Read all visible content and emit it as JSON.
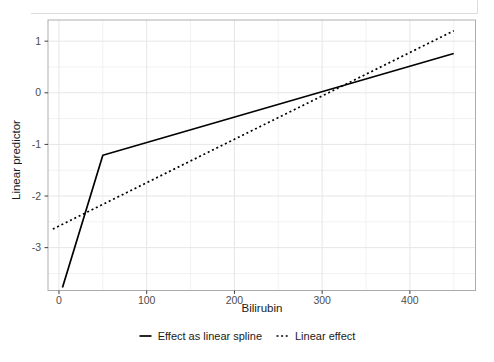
{
  "chart_data": {
    "type": "line",
    "title": "",
    "xlabel": "Bilirubin",
    "ylabel": "Linear predictor",
    "x_ticks": [
      0,
      100,
      200,
      300,
      400
    ],
    "x_tick_labels": [
      "0",
      "100",
      "200",
      "300",
      "400"
    ],
    "x_minor_ticks": [
      50,
      150,
      250,
      350,
      450
    ],
    "y_ticks": [
      1,
      0,
      -1,
      -2,
      -3
    ],
    "y_tick_labels": [
      "1",
      "0",
      "-1",
      "-2",
      "-3"
    ],
    "y_minor_ticks": [
      0.5,
      -0.5,
      -1.5,
      -2.5,
      -3.5
    ],
    "x_range": [
      -12.5,
      474.8
    ],
    "y_range": [
      -3.83,
      1.41
    ],
    "grid": "major+minor",
    "legend_position": "bottom",
    "series": [
      {
        "name": "Effect as linear spline",
        "style": "solid",
        "color": "#000000",
        "points": [
          [
            4,
            -3.77
          ],
          [
            50,
            -1.21
          ],
          [
            450,
            0.76
          ]
        ]
      },
      {
        "name": "Linear effect",
        "style": "dotted",
        "color": "#000000",
        "points": [
          [
            -7,
            -2.64
          ],
          [
            450,
            1.2
          ]
        ],
        "intercept": -2.61,
        "slope": 0.00845
      }
    ]
  },
  "colors": {
    "line": "#000000",
    "grid_major": "#e6e6e6",
    "grid_minor": "#f2f2f2",
    "panel_border": "#a9adb0",
    "tick": "#404040",
    "tick_label": "#4d4d4d",
    "artifact": "#dcdcdc"
  }
}
